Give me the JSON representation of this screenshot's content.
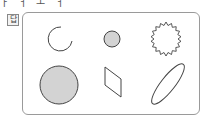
{
  "header": {
    "cut_text": "ㅏ ㅓ ㅗ ㅓ"
  },
  "answer_label": "답",
  "shapes": [
    {
      "name": "open-arc",
      "row": 1,
      "col": 1,
      "filled": false
    },
    {
      "name": "small-filled-circle",
      "row": 1,
      "col": 2,
      "filled": true
    },
    {
      "name": "starburst",
      "row": 1,
      "col": 3,
      "filled": false
    },
    {
      "name": "large-filled-circle",
      "row": 2,
      "col": 1,
      "filled": true
    },
    {
      "name": "rhombus",
      "row": 2,
      "col": 2,
      "filled": false
    },
    {
      "name": "tilted-ellipse",
      "row": 2,
      "col": 3,
      "filled": false
    }
  ],
  "colors": {
    "stroke": "#444444",
    "fill": "#d3d3d3",
    "border": "#9a9a9a"
  }
}
